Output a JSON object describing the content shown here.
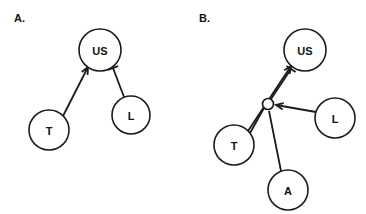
{
  "figure": {
    "width": 366,
    "height": 214,
    "background_color": "#ffffff",
    "stroke_color": "#1c1c1c",
    "text_color": "#131313",
    "type": "node-link causal diagram",
    "panel_count": 2
  },
  "panels": [
    {
      "id": "panel-a",
      "label": "A.",
      "label_x": 14,
      "label_y": 22,
      "nodes": [
        {
          "id": "us",
          "label": "US",
          "cx": 100,
          "cy": 50,
          "r": 21
        },
        {
          "id": "t",
          "label": "T",
          "cx": 49,
          "cy": 130,
          "r": 20
        },
        {
          "id": "l",
          "label": "L",
          "cx": 131,
          "cy": 115,
          "r": 19
        }
      ],
      "junctions": [],
      "edges": [
        {
          "id": "a-t-to-us",
          "from": "T",
          "to": "US",
          "head": "arrow",
          "x1": 63,
          "y1": 116,
          "x2": 88,
          "y2": 67
        },
        {
          "id": "a-l-to-us",
          "from": "L",
          "to": "US",
          "head": "inhibit",
          "x1": 124,
          "y1": 97,
          "x2": 113,
          "y2": 68
        }
      ]
    },
    {
      "id": "panel-b",
      "label": "B.",
      "label_x": 199,
      "label_y": 22,
      "nodes": [
        {
          "id": "us",
          "label": "US",
          "cx": 305,
          "cy": 50,
          "r": 21
        },
        {
          "id": "t",
          "label": "T",
          "cx": 234,
          "cy": 145,
          "r": 20
        },
        {
          "id": "l",
          "label": "L",
          "cx": 335,
          "cy": 118,
          "r": 20
        },
        {
          "id": "a",
          "label": "A",
          "cx": 288,
          "cy": 190,
          "r": 20
        }
      ],
      "junctions": [
        {
          "id": "b-junction",
          "cx": 268,
          "cy": 104,
          "r": 5.5
        }
      ],
      "edges": [
        {
          "id": "b-t-to-us",
          "from": "T",
          "to": "US",
          "head": "arrow",
          "x1": 248,
          "y1": 131,
          "x2": 291,
          "y2": 66
        },
        {
          "id": "b-t-to-junction",
          "from": "T",
          "to": "junction",
          "head": "none",
          "x1": 250,
          "y1": 133,
          "x2": 264,
          "y2": 108
        },
        {
          "id": "b-junction-to-us",
          "from": "junction",
          "to": "US",
          "head": "inhibit",
          "x1": 271,
          "y1": 99,
          "x2": 291,
          "y2": 69
        },
        {
          "id": "b-l-to-junction",
          "from": "L",
          "to": "junction",
          "head": "arrow",
          "x1": 316,
          "y1": 112,
          "x2": 276,
          "y2": 105
        },
        {
          "id": "b-a-to-junction",
          "from": "A",
          "to": "junction",
          "head": "none",
          "x1": 281,
          "y1": 171,
          "x2": 269,
          "y2": 111
        }
      ]
    }
  ]
}
